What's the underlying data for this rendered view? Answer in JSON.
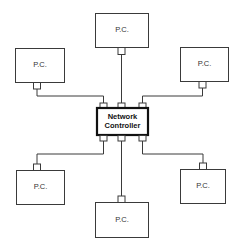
{
  "diagram": {
    "type": "star-network",
    "controller": {
      "line1": "Network",
      "line2": "Controller"
    },
    "nodes": [
      {
        "id": "top",
        "label": "P.C."
      },
      {
        "id": "top-left",
        "label": "P.C."
      },
      {
        "id": "top-right",
        "label": "P.C."
      },
      {
        "id": "bottom-left",
        "label": "P.C."
      },
      {
        "id": "bottom-right",
        "label": "P.C."
      },
      {
        "id": "bottom",
        "label": "P.C."
      }
    ]
  }
}
